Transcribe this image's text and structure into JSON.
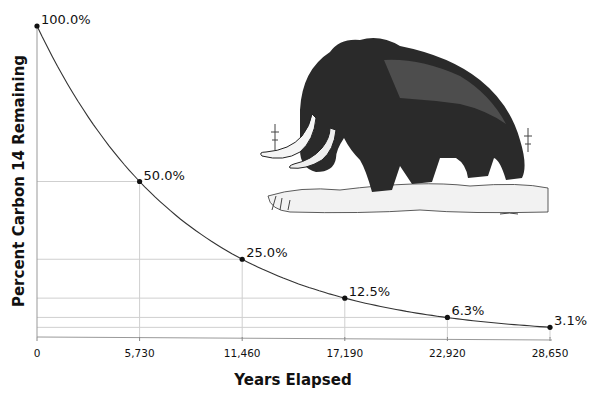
{
  "chart_data": {
    "type": "line",
    "title": "",
    "xlabel": "Years Elapsed",
    "ylabel": "Percent Carbon 14 Remaining",
    "x": [
      0,
      5730,
      11460,
      17190,
      22920,
      28650
    ],
    "x_tick_labels": [
      "0",
      "5,730",
      "11,460",
      "17,190",
      "22,920",
      "28,650"
    ],
    "series": [
      {
        "name": "Carbon 14 remaining",
        "values": [
          100.0,
          50.0,
          25.0,
          12.5,
          6.3,
          3.1
        ],
        "point_labels": [
          "100.0%",
          "50.0%",
          "25.0%",
          "12.5%",
          "6.3%",
          "3.1%"
        ]
      }
    ],
    "xlim": [
      0,
      28650
    ],
    "ylim": [
      0,
      100
    ],
    "grid": "drop lines from each point to both axes",
    "legend": "none",
    "annotations": [
      "Illustration of a woolly mammoth in upper right of plot area"
    ]
  },
  "colors": {
    "line": "#333333",
    "grid": "#cfcfcf",
    "axis": "#888888",
    "text": "#111111"
  }
}
